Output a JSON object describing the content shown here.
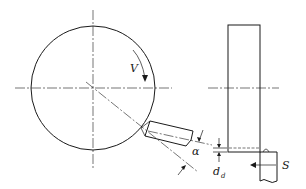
{
  "diagram": {
    "title": "",
    "labels": {
      "velocity": "V",
      "angle": "α",
      "depth": "d",
      "depth_sub": "d",
      "feed": "S"
    },
    "components": [
      "grinding-wheel-side-view",
      "cutting-tool",
      "grinding-wheel-front-view",
      "workpiece"
    ],
    "color": "#1a1a1a"
  }
}
